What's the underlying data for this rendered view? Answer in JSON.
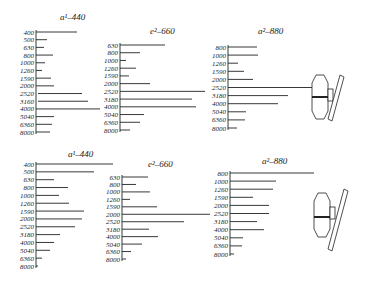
{
  "figure": {
    "panels": [
      {
        "id": "top-left",
        "title": "a¹–440",
        "title_x": 60,
        "title_y": 20,
        "axis_x": 36,
        "y_start": 32,
        "y_end": 132,
        "rows": [
          {
            "label": "400",
            "end": 77
          },
          {
            "label": "500",
            "end": 47
          },
          {
            "label": "630",
            "end": 44
          },
          {
            "label": "800",
            "end": 53
          },
          {
            "label": "1000",
            "end": 45
          },
          {
            "label": "1260",
            "end": 42
          },
          {
            "label": "1590",
            "end": 51
          },
          {
            "label": "2000",
            "end": 54
          },
          {
            "label": "2520",
            "end": 82,
            "start": 38
          },
          {
            "label": "3160",
            "end": 88,
            "start": 38
          },
          {
            "label": "4000",
            "end": 100
          },
          {
            "label": "5040",
            "end": 54
          },
          {
            "label": "6360",
            "end": 52
          },
          {
            "label": "8000",
            "end": 50
          }
        ]
      },
      {
        "id": "top-middle",
        "title": "e²–660",
        "title_x": 150,
        "title_y": 34,
        "axis_x": 120,
        "y_start": 45,
        "y_end": 130,
        "rows": [
          {
            "label": "630",
            "end": 165
          },
          {
            "label": "800",
            "end": 140
          },
          {
            "label": "1000",
            "end": 126
          },
          {
            "label": "1260",
            "end": 136
          },
          {
            "label": "1590",
            "end": 129
          },
          {
            "label": "2000",
            "end": 150
          },
          {
            "label": "2520",
            "end": 205
          },
          {
            "label": "3180",
            "end": 192
          },
          {
            "label": "4000",
            "end": 196
          },
          {
            "label": "5040",
            "end": 144
          },
          {
            "label": "6360",
            "end": 140
          },
          {
            "label": "8000",
            "end": 130
          }
        ]
      },
      {
        "id": "top-right",
        "title": "a²–880",
        "title_x": 258,
        "title_y": 34,
        "axis_x": 228,
        "y_start": 47,
        "y_end": 128,
        "rows": [
          {
            "label": "800",
            "end": 257
          },
          {
            "label": "1000",
            "end": 258
          },
          {
            "label": "1260",
            "end": 238
          },
          {
            "label": "1590",
            "end": 244
          },
          {
            "label": "2000",
            "end": 253
          },
          {
            "label": "2520",
            "end": 312
          },
          {
            "label": "3180",
            "end": 288
          },
          {
            "label": "4000",
            "end": 278
          },
          {
            "label": "5040",
            "end": 246
          },
          {
            "label": "6360",
            "end": 245
          },
          {
            "label": "8000",
            "end": 237
          }
        ]
      },
      {
        "id": "bottom-left",
        "title": "a¹–440",
        "title_x": 68,
        "title_y": 157,
        "axis_x": 36,
        "y_start": 164,
        "y_end": 266,
        "rows": [
          {
            "label": "400",
            "end": 113
          },
          {
            "label": "500",
            "end": 94
          },
          {
            "label": "630",
            "end": 54
          },
          {
            "label": "800",
            "end": 68
          },
          {
            "label": "1000",
            "end": 59
          },
          {
            "label": "1260",
            "end": 69
          },
          {
            "label": "1590",
            "end": 84
          },
          {
            "label": "2000",
            "end": 82
          },
          {
            "label": "2520",
            "end": 75
          },
          {
            "label": "3180",
            "end": 60
          },
          {
            "label": "4000",
            "end": 54
          },
          {
            "label": "5040",
            "end": 50
          },
          {
            "label": "6360",
            "end": 42
          },
          {
            "label": "8000",
            "end": 38
          }
        ]
      },
      {
        "id": "bottom-middle",
        "title": "e²–660",
        "title_x": 148,
        "title_y": 167,
        "axis_x": 122,
        "y_start": 177,
        "y_end": 259,
        "rows": [
          {
            "label": "630",
            "end": 148
          },
          {
            "label": "800",
            "end": 136
          },
          {
            "label": "1000",
            "end": 150
          },
          {
            "label": "1260",
            "end": 130
          },
          {
            "label": "1590",
            "end": 157
          },
          {
            "label": "2000",
            "end": 210
          },
          {
            "label": "2520",
            "end": 184
          },
          {
            "label": "3180",
            "end": 149
          },
          {
            "label": "4000",
            "end": 158
          },
          {
            "label": "5040",
            "end": 142
          },
          {
            "label": "6360",
            "end": 131
          },
          {
            "label": "8000",
            "end": 126
          }
        ]
      },
      {
        "id": "bottom-right",
        "title": "a²–880",
        "title_x": 262,
        "title_y": 164,
        "axis_x": 230,
        "y_start": 173,
        "y_end": 254,
        "rows": [
          {
            "label": "800",
            "end": 314
          },
          {
            "label": "1000",
            "end": 276
          },
          {
            "label": "1260",
            "end": 273
          },
          {
            "label": "1590",
            "end": 253
          },
          {
            "label": "2000",
            "end": 269
          },
          {
            "label": "2520",
            "end": 269
          },
          {
            "label": "3180",
            "end": 257
          },
          {
            "label": "4000",
            "end": 264
          },
          {
            "label": "5040",
            "end": 243
          },
          {
            "label": "6360",
            "end": 242
          },
          {
            "label": "8000",
            "end": 234
          }
        ]
      }
    ],
    "instrument_sketches": [
      {
        "id": "top",
        "cx": 326,
        "cy": 97
      },
      {
        "id": "bottom",
        "cx": 328,
        "cy": 215
      }
    ],
    "colors": {
      "ink": "#222222",
      "background": "#ffffff"
    }
  }
}
